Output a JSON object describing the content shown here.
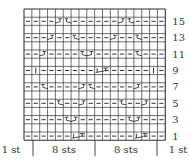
{
  "chart": {
    "cols": 18,
    "rows": 16,
    "grid": {
      "x": 24,
      "y": 9,
      "cell_w": 7.85,
      "cell_h": 8.2
    },
    "row_labels": [
      "1",
      "3",
      "5",
      "7",
      "9",
      "11",
      "13",
      "15"
    ],
    "bottom_labels": [
      {
        "text": "1 st",
        "x": 11
      },
      {
        "text": "8 sts",
        "x": 64
      },
      {
        "text": "8 sts",
        "x": 126
      },
      {
        "text": "1 st",
        "x": 178
      }
    ],
    "dividers_x": [
      33,
      95,
      157
    ],
    "legend": {
      "-": "purl",
      "I": "knit",
      "RT": "right twist (2 sts)",
      "LT": "left twist (2 sts)"
    },
    "pattern_rows": {
      "1": [
        "-",
        "-",
        "-",
        "-",
        "-",
        "-",
        "LT2",
        "-",
        "-",
        "-",
        "-",
        "-",
        "-",
        "-",
        "LT2",
        "-",
        "-",
        "-"
      ],
      "3": [
        "-",
        "-",
        "-",
        "-",
        "-",
        "RT",
        "LT",
        "-",
        "-",
        "-",
        "-",
        "-",
        "-",
        "RT",
        "LT",
        "-",
        "-",
        "-"
      ],
      "5": [
        "-",
        "-",
        "-",
        "-",
        "RT",
        "-",
        "-",
        "LT",
        "-",
        "-",
        "-",
        "-",
        "RT",
        "-",
        "-",
        "LT",
        "-",
        "-"
      ],
      "7": [
        "-",
        "-",
        "RT",
        "-",
        "-",
        "-",
        "-",
        "LT",
        "RT",
        "-",
        "-",
        "-",
        "-",
        "-",
        "LT",
        "-",
        "-",
        "-"
      ],
      "9": [
        "-",
        "I",
        "-",
        "-",
        "-",
        "-",
        "-",
        "-",
        "-",
        "LT2",
        "-",
        "-",
        "-",
        "-",
        "-",
        "-",
        "I",
        "-"
      ],
      "11": [
        "-",
        "-",
        "LT",
        "-",
        "-",
        "-",
        "-",
        "RT",
        "LT",
        "-",
        "-",
        "-",
        "-",
        "-",
        "RT",
        "-",
        "-",
        "-"
      ],
      "13": [
        "-",
        "-",
        "-",
        "LT",
        "-",
        "-",
        "RT",
        "-",
        "-",
        "-",
        "-",
        "LT",
        "-",
        "-",
        "RT",
        "-",
        "-",
        "-"
      ],
      "15": [
        "-",
        "-",
        "-",
        "-",
        "LT",
        "RT",
        "-",
        "-",
        "-",
        "-",
        "-",
        "-",
        "LT",
        "RT",
        "-",
        "-",
        "-",
        "-"
      ]
    },
    "colors": {
      "line": "#333333",
      "background": "#ffffff",
      "text": "#333333"
    }
  }
}
